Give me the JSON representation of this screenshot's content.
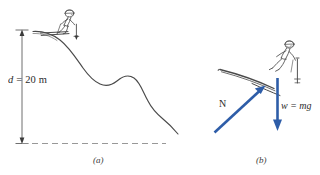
{
  "figure": {
    "panels": [
      {
        "id": "a",
        "caption": "(a)",
        "dimension": {
          "symbol": "d",
          "equals": "=",
          "value": "20",
          "unit": "m",
          "full_text": "d = 20 m"
        },
        "elements": [
          "ski-slope-curve",
          "skier-figure",
          "dimension-arrow",
          "ground-dashed-line"
        ]
      },
      {
        "id": "b",
        "caption": "(b)",
        "vectors": [
          {
            "name": "N",
            "label": "N",
            "description": "normal-force-arrow",
            "color": "#2e5da8",
            "direction": "up-right"
          },
          {
            "name": "w",
            "label": "w = mg",
            "label_symbol": "w",
            "label_equals": "=",
            "label_expr": "mg",
            "description": "weight-force-arrow",
            "color": "#2e5da8",
            "direction": "down"
          }
        ],
        "elements": [
          "skier-figure",
          "ski-line",
          "normal-force-arrow",
          "weight-force-arrow"
        ]
      }
    ],
    "colors": {
      "vector_blue": "#2e5da8",
      "line_dark": "#3a3a3a",
      "background": "#ffffff",
      "dashed_gray": "#8c8c8c"
    }
  }
}
